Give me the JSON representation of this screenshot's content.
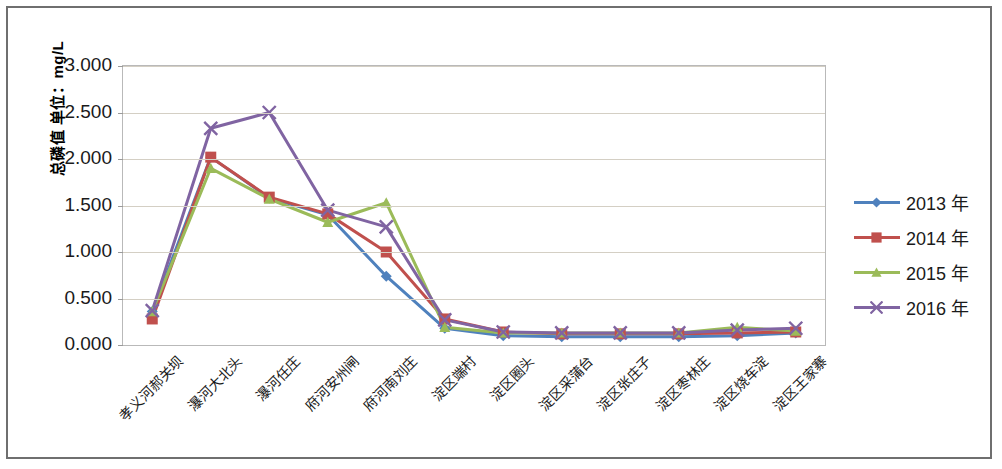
{
  "chart_data": {
    "type": "line",
    "title": "",
    "xlabel": "",
    "ylabel": "总磷值 单位：mg/L",
    "ylim": [
      0,
      3
    ],
    "ytick_labels": [
      "3.000",
      "2.500",
      "2.000",
      "1.500",
      "1.000",
      "0.500",
      "0.000"
    ],
    "ytick_values": [
      3.0,
      2.5,
      2.0,
      1.5,
      1.0,
      0.5,
      0.0
    ],
    "grid": true,
    "legend_position": "right",
    "categories": [
      "孝义河郝关坝",
      "瀑河大北头",
      "瀑河任庄",
      "府河安州闸",
      "府河南刘庄",
      "淀区端村",
      "淀区圈头",
      "淀区采蒲台",
      "淀区张庄子",
      "淀区枣林庄",
      "淀区烧车淀",
      "淀区王家寨"
    ],
    "series": [
      {
        "name": "2013 年",
        "color": "#4f81bd",
        "marker": "diamond",
        "values": [
          0.36,
          2.02,
          1.58,
          1.4,
          0.74,
          0.18,
          0.1,
          0.09,
          0.09,
          0.09,
          0.1,
          0.13
        ]
      },
      {
        "name": "2014 年",
        "color": "#c0504d",
        "marker": "square",
        "values": [
          0.28,
          2.02,
          1.59,
          1.41,
          1.0,
          0.28,
          0.14,
          0.12,
          0.12,
          0.12,
          0.13,
          0.14
        ]
      },
      {
        "name": "2015 年",
        "color": "#9bbb59",
        "marker": "triangle",
        "values": [
          0.36,
          1.9,
          1.57,
          1.32,
          1.53,
          0.19,
          0.13,
          0.13,
          0.13,
          0.13,
          0.19,
          0.15
        ]
      },
      {
        "name": "2016 年",
        "color": "#8064a2",
        "marker": "cross",
        "values": [
          0.37,
          2.33,
          2.5,
          1.45,
          1.27,
          0.27,
          0.14,
          0.13,
          0.13,
          0.13,
          0.16,
          0.18
        ]
      }
    ]
  },
  "legend": {
    "entries": [
      {
        "label": "2013 年"
      },
      {
        "label": "2014 年"
      },
      {
        "label": "2015 年"
      },
      {
        "label": "2016 年"
      }
    ]
  }
}
